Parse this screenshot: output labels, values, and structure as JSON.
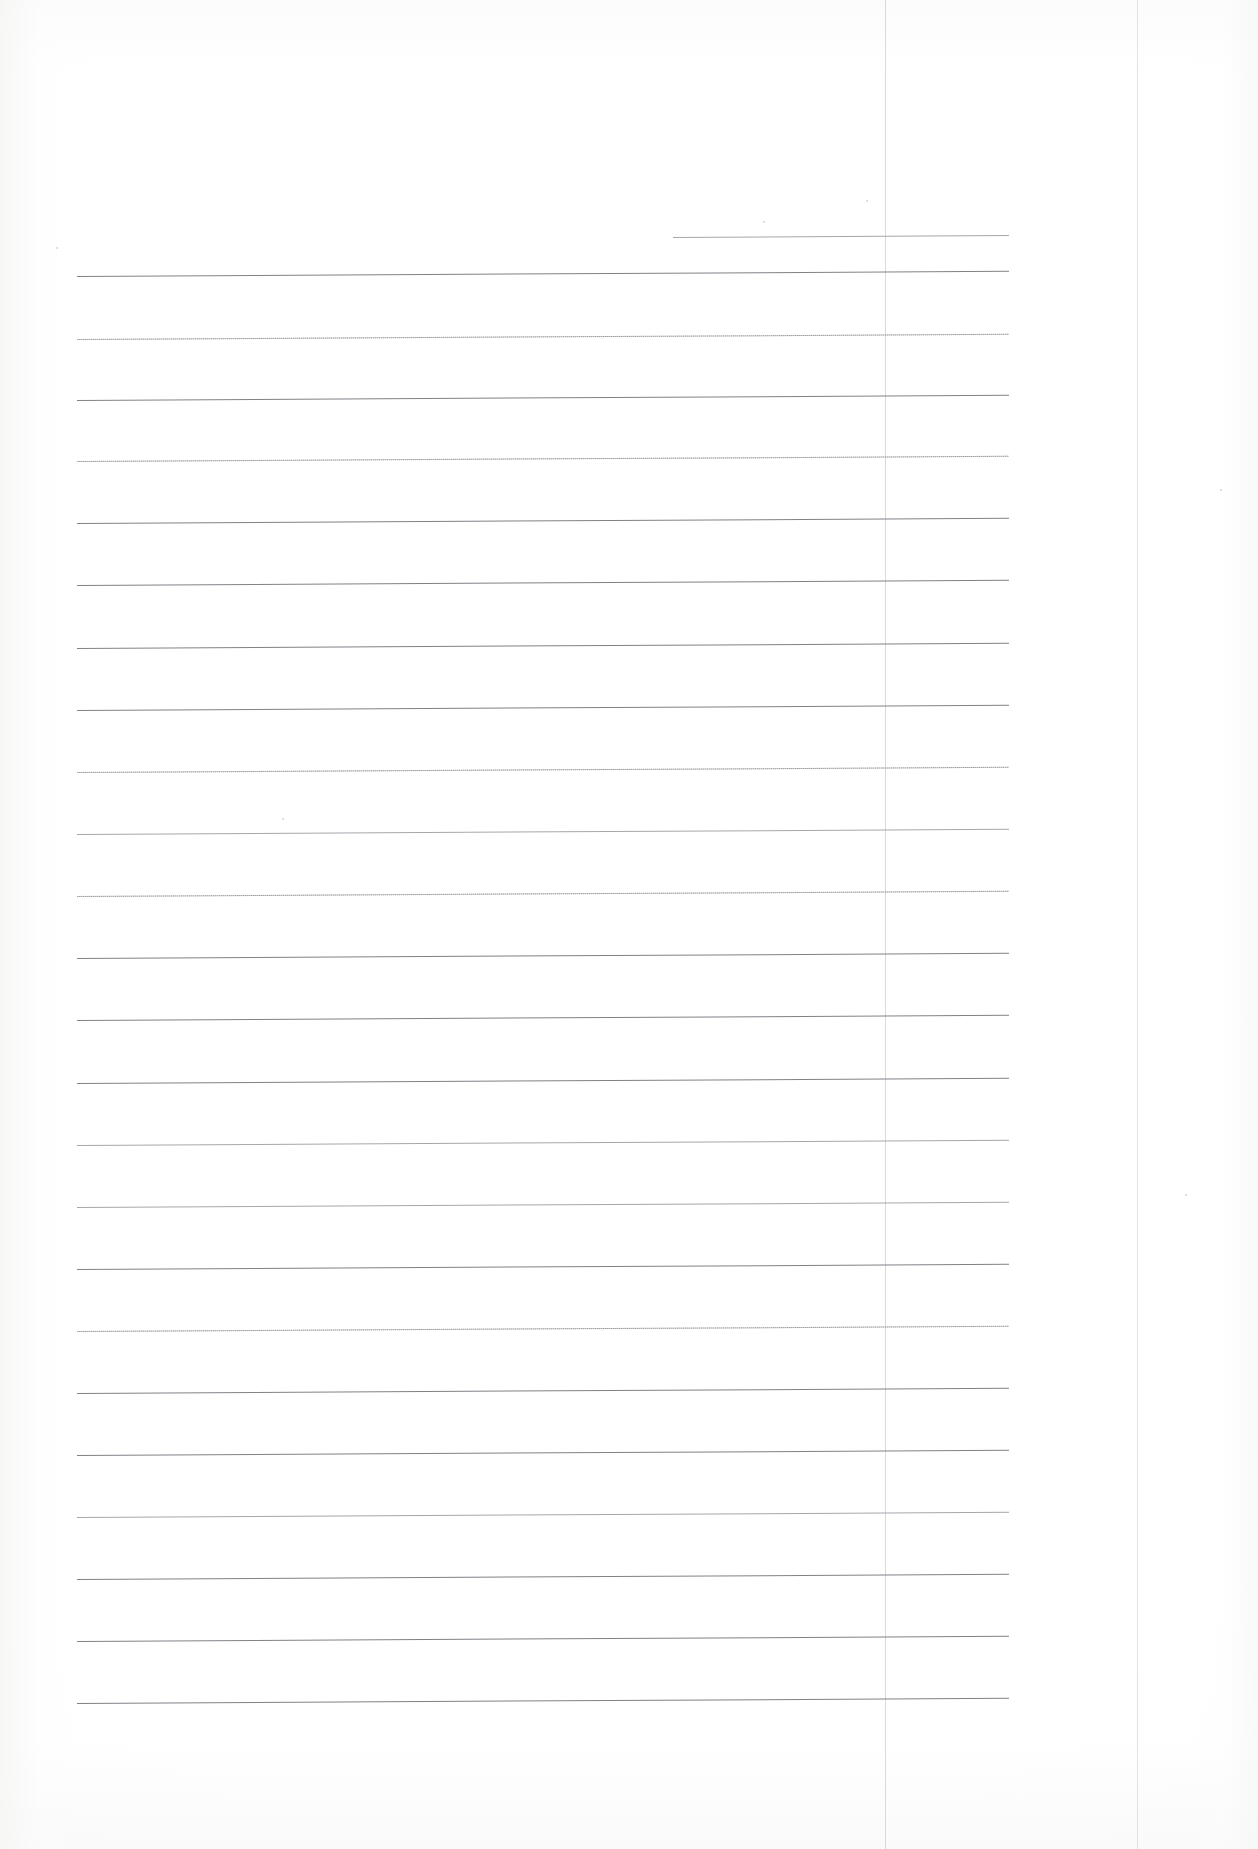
{
  "document": {
    "kind": "scanned-blank-ruled-page",
    "page_width": 1258,
    "page_height": 1849,
    "background_color": "#ffffff",
    "visible_text": "",
    "note": ""
  },
  "ruling": {
    "line_color": "#8e9094",
    "faint_line_color": "#c0c2c6",
    "line_start_x": 77,
    "line_end_x": 1009,
    "skew_degrees": -0.32,
    "spacing": 63,
    "count": 25,
    "lines": [
      {
        "y": 237,
        "x1": 673,
        "x2": 1009,
        "weight": "soft",
        "style": "solid"
      },
      {
        "y": 276,
        "x1": 77,
        "x2": 1009,
        "weight": "strong",
        "style": "solid"
      },
      {
        "y": 339,
        "x1": 77,
        "x2": 1009,
        "weight": "faint",
        "style": "dotted"
      },
      {
        "y": 400,
        "x1": 77,
        "x2": 1009,
        "weight": "strong",
        "style": "solid"
      },
      {
        "y": 461,
        "x1": 77,
        "x2": 1009,
        "weight": "faint",
        "style": "dotted"
      },
      {
        "y": 523,
        "x1": 77,
        "x2": 1009,
        "weight": "strong",
        "style": "solid"
      },
      {
        "y": 585,
        "x1": 77,
        "x2": 1009,
        "weight": "strong",
        "style": "solid"
      },
      {
        "y": 648,
        "x1": 77,
        "x2": 1009,
        "weight": "strong",
        "style": "solid"
      },
      {
        "y": 710,
        "x1": 77,
        "x2": 1009,
        "weight": "strong",
        "style": "solid"
      },
      {
        "y": 772,
        "x1": 77,
        "x2": 1009,
        "weight": "faint",
        "style": "dotted"
      },
      {
        "y": 834,
        "x1": 77,
        "x2": 1009,
        "weight": "soft",
        "style": "solid"
      },
      {
        "y": 896,
        "x1": 77,
        "x2": 1009,
        "weight": "faint",
        "style": "dotted"
      },
      {
        "y": 958,
        "x1": 77,
        "x2": 1009,
        "weight": "strong",
        "style": "solid"
      },
      {
        "y": 1020,
        "x1": 77,
        "x2": 1009,
        "weight": "strong",
        "style": "solid"
      },
      {
        "y": 1083,
        "x1": 77,
        "x2": 1009,
        "weight": "strong",
        "style": "solid"
      },
      {
        "y": 1145,
        "x1": 77,
        "x2": 1009,
        "weight": "soft",
        "style": "solid"
      },
      {
        "y": 1207,
        "x1": 77,
        "x2": 1009,
        "weight": "soft",
        "style": "solid"
      },
      {
        "y": 1269,
        "x1": 77,
        "x2": 1009,
        "weight": "strong",
        "style": "solid"
      },
      {
        "y": 1331,
        "x1": 77,
        "x2": 1009,
        "weight": "faint",
        "style": "dotted"
      },
      {
        "y": 1393,
        "x1": 77,
        "x2": 1009,
        "weight": "strong",
        "style": "solid"
      },
      {
        "y": 1455,
        "x1": 77,
        "x2": 1009,
        "weight": "strong",
        "style": "solid"
      },
      {
        "y": 1517,
        "x1": 77,
        "x2": 1009,
        "weight": "soft",
        "style": "solid"
      },
      {
        "y": 1579,
        "x1": 77,
        "x2": 1009,
        "weight": "strong",
        "style": "solid"
      },
      {
        "y": 1641,
        "x1": 77,
        "x2": 1009,
        "weight": "strong",
        "style": "solid"
      },
      {
        "y": 1703,
        "x1": 77,
        "x2": 1009,
        "weight": "strong",
        "style": "solid"
      }
    ]
  },
  "vertical_rules": {
    "color": "#d9dadd",
    "lines": [
      {
        "x": 885,
        "y1": 0,
        "y2": 1849,
        "weight": "normal"
      },
      {
        "x": 1137,
        "y1": 0,
        "y2": 1849,
        "weight": "faint"
      }
    ]
  },
  "specks": [
    {
      "x": 763,
      "y": 221
    },
    {
      "x": 866,
      "y": 200
    },
    {
      "x": 56,
      "y": 247
    },
    {
      "x": 1220,
      "y": 489
    },
    {
      "x": 1185,
      "y": 1194
    },
    {
      "x": 282,
      "y": 818
    }
  ]
}
